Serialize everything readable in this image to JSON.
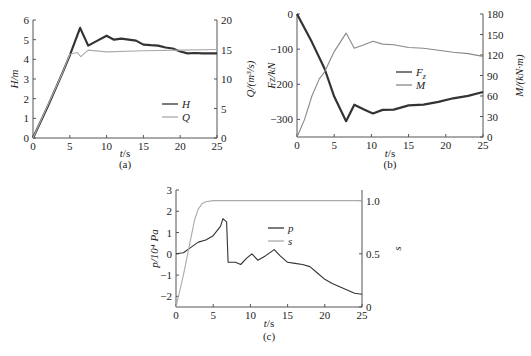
{
  "chart_data": [
    {
      "panel": "(a)",
      "type": "line",
      "xlabel": "t/s",
      "ylabel": "H/m",
      "y2label": "Q/(m³/s)",
      "xlim": [
        0,
        25
      ],
      "ylim": [
        0,
        6
      ],
      "y2lim": [
        0,
        20
      ],
      "xticks": [
        0,
        5,
        10,
        15,
        20,
        25
      ],
      "yticks": [
        0,
        1,
        2,
        3,
        4,
        5,
        6
      ],
      "y2ticks": [
        0,
        5,
        10,
        15,
        20
      ],
      "legend": [
        "H",
        "Q"
      ],
      "legend_position": "lower right",
      "series": [
        {
          "name": "H",
          "axis": "left",
          "color": "#333333",
          "x": [
            0,
            2,
            4,
            5,
            6.4,
            7.5,
            8.5,
            10,
            11,
            12,
            13,
            14,
            15,
            16,
            17,
            18,
            19,
            20,
            21,
            22,
            23,
            24,
            25
          ],
          "y": [
            0,
            1.6,
            3.3,
            4.2,
            5.6,
            4.7,
            4.9,
            5.2,
            5.0,
            5.05,
            5.0,
            4.95,
            4.75,
            4.72,
            4.7,
            4.6,
            4.55,
            4.4,
            4.3,
            4.32,
            4.3,
            4.3,
            4.3
          ]
        },
        {
          "name": "Q",
          "axis": "right",
          "color": "#aaaaaa",
          "x": [
            0,
            2,
            4,
            5,
            6,
            6.5,
            7.5,
            10,
            15,
            20,
            25
          ],
          "y": [
            0,
            5.5,
            11.0,
            14.2,
            14.5,
            13.8,
            14.9,
            14.6,
            14.8,
            14.9,
            15.0
          ]
        }
      ]
    },
    {
      "panel": "(b)",
      "type": "line",
      "xlabel": "t/s",
      "ylabel": "Fz/kN",
      "y2label": "M/(kN·m)",
      "xlim": [
        0,
        25
      ],
      "ylim": [
        -350,
        0
      ],
      "y2lim": [
        0,
        180
      ],
      "xticks": [
        0,
        5,
        10,
        15,
        20,
        25
      ],
      "yticks": [
        0,
        -100,
        -200,
        -300
      ],
      "y2ticks": [
        0,
        30,
        60,
        90,
        120,
        150,
        180
      ],
      "legend": [
        "Fz",
        "M"
      ],
      "legend_position": "center",
      "series": [
        {
          "name": "Fz",
          "axis": "left",
          "color": "#333333",
          "x": [
            0,
            2,
            3.7,
            5,
            6.6,
            7.7,
            9,
            10.2,
            11.5,
            13,
            15,
            17,
            19,
            21,
            23,
            25
          ],
          "y": [
            0,
            -80,
            -155,
            -235,
            -305,
            -258,
            -272,
            -283,
            -273,
            -272,
            -260,
            -258,
            -250,
            -240,
            -233,
            -222
          ]
        },
        {
          "name": "M",
          "axis": "right",
          "color": "#888888",
          "x": [
            0,
            1,
            2,
            3,
            3.7,
            5,
            6.6,
            7.7,
            9,
            10.2,
            11.5,
            13,
            15,
            17,
            19,
            21,
            23,
            25
          ],
          "y": [
            0,
            25,
            60,
            85,
            95,
            125,
            152,
            130,
            135,
            140,
            136,
            135,
            131,
            130,
            127,
            124,
            122,
            118
          ]
        }
      ]
    },
    {
      "panel": "(c)",
      "type": "line",
      "xlabel": "t/s",
      "ylabel": "p/10⁴ Pa",
      "y2label": "s",
      "xlim": [
        0,
        25
      ],
      "ylim": [
        -2.5,
        3
      ],
      "y2lim": [
        0,
        1.1
      ],
      "xticks": [
        0,
        5,
        10,
        15,
        20,
        25
      ],
      "yticks": [
        -2,
        -1,
        0,
        1,
        2,
        3
      ],
      "y2ticks": [
        0,
        0.5,
        1.0
      ],
      "legend": [
        "p",
        "s"
      ],
      "legend_position": "center",
      "series": [
        {
          "name": "p",
          "axis": "left",
          "color": "#333333",
          "x": [
            0,
            1,
            2,
            3,
            4,
            5,
            6,
            6.3,
            6.8,
            7,
            8,
            8.7,
            9.5,
            10.2,
            11,
            12,
            13.2,
            14,
            15,
            16,
            17,
            18,
            19,
            20,
            21,
            22,
            23,
            24,
            25
          ],
          "y": [
            0,
            0.05,
            0.3,
            0.55,
            0.65,
            0.85,
            1.3,
            1.65,
            1.5,
            -0.4,
            -0.4,
            -0.5,
            -0.2,
            0.0,
            -0.3,
            -0.1,
            0.2,
            -0.1,
            -0.4,
            -0.45,
            -0.5,
            -0.6,
            -0.9,
            -1.2,
            -1.4,
            -1.55,
            -1.7,
            -1.85,
            -1.9
          ]
        },
        {
          "name": "s",
          "axis": "right",
          "color": "#aaaaaa",
          "x": [
            0,
            1,
            2,
            2.5,
            3,
            3.5,
            4,
            5,
            10,
            15,
            20,
            25
          ],
          "y": [
            0,
            0.3,
            0.65,
            0.82,
            0.92,
            0.97,
            0.99,
            1.0,
            1.0,
            1.0,
            1.0,
            1.0
          ]
        }
      ]
    }
  ],
  "panels": {
    "a": {
      "tag": "(a)",
      "xlabel": "t/s",
      "ylabel": "H/m",
      "y2label": "Q/(m³/s)",
      "legend": [
        "H",
        "Q"
      ]
    },
    "b": {
      "tag": "(b)",
      "xlabel": "t/s",
      "ylabel": "Fz/kN",
      "y2label": "M/(kN·m)",
      "legend": [
        "Fz",
        "M"
      ]
    },
    "c": {
      "tag": "(c)",
      "xlabel": "t/s",
      "ylabel": "p/10⁴ Pa",
      "y2label": "s",
      "legend": [
        "p",
        "s"
      ]
    }
  },
  "caption": ""
}
